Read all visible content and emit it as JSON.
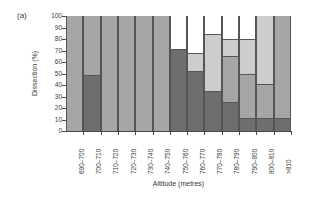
{
  "panel": {
    "label": "(a)"
  },
  "chart_data": {
    "type": "bar",
    "subtype": "stacked-bar-100-percent",
    "title": "",
    "panel_label": "(a)",
    "xlabel": "Altitude (metres)",
    "ylabel": "Dissection (%)",
    "ylim": [
      0,
      100
    ],
    "yticks": [
      0,
      10,
      20,
      30,
      40,
      50,
      60,
      70,
      80,
      90,
      100
    ],
    "grid": false,
    "legend": "none",
    "categories": [
      "690–700",
      "700–710",
      "710–720",
      "720–730",
      "730–740",
      "740–750",
      "750–760",
      "760–770",
      "770–780",
      "780–790",
      "790–800",
      "800–810",
      ">810"
    ],
    "series": [
      {
        "name": "class-1-dark-grey",
        "color": "#6e6e6e",
        "values": [
          0,
          49,
          0,
          0,
          0,
          0,
          71,
          52,
          35,
          25,
          11,
          11,
          11
        ]
      },
      {
        "name": "class-2-medium-grey",
        "color": "#a6a6a6",
        "values": [
          100,
          51,
          100,
          100,
          100,
          100,
          0,
          0,
          0,
          40,
          39,
          30,
          89
        ]
      },
      {
        "name": "class-3-light-grey",
        "color": "#cdcdcd",
        "values": [
          0,
          0,
          0,
          0,
          0,
          0,
          0,
          16,
          49,
          15,
          30,
          59,
          0
        ]
      },
      {
        "name": "class-4-white",
        "color": "#ffffff",
        "values": [
          0,
          0,
          0,
          0,
          0,
          0,
          29,
          32,
          16,
          20,
          20,
          0,
          0
        ]
      }
    ],
    "cumulative_tops": {
      "690–700": [
        0,
        100,
        100,
        100
      ],
      "700–710": [
        49,
        100,
        100,
        100
      ],
      "710–720": [
        0,
        100,
        100,
        100
      ],
      "720–730": [
        0,
        100,
        100,
        100
      ],
      "730–740": [
        0,
        100,
        100,
        100
      ],
      "740–750": [
        0,
        100,
        100,
        100
      ],
      "750–760": [
        71,
        71,
        71,
        100
      ],
      "760–770": [
        52,
        52,
        68,
        100
      ],
      "770–780": [
        35,
        35,
        84,
        100
      ],
      "780–790": [
        25,
        65,
        80,
        100
      ],
      "790–800": [
        11,
        50,
        80,
        100
      ],
      "800–810": [
        11,
        41,
        100,
        100
      ],
      ">810": [
        11,
        100,
        100,
        100
      ]
    },
    "axis_colors": {
      "line": "#4a4a4a",
      "text": "#3a3a3a",
      "bar_edge": "#555555"
    }
  }
}
